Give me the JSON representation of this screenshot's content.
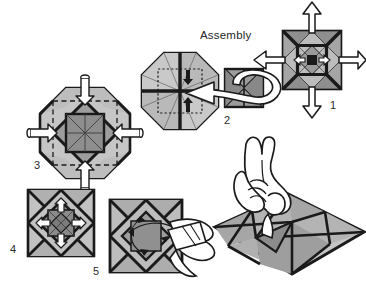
{
  "figure": {
    "title": "Assembly",
    "kind": "origami-assembly-diagram",
    "background_color": "#ffffff",
    "palette": {
      "ink": "#1a1a1a",
      "line": "#222222",
      "fill_light": "#c9c9c9",
      "fill_mid": "#a8a8a8",
      "fill_dark": "#8a8a8a",
      "fill_darker": "#707070",
      "arrow_fill": "#ffffff",
      "arrow_stroke": "#1a1a1a",
      "dash": "#2a2a2a"
    }
  },
  "steps": [
    {
      "number": "1",
      "label_x": 330,
      "label_y": 100,
      "shape": "square",
      "note": "Square module with four white outward arrows (up, down, left, right)",
      "arrows": [
        "up",
        "down",
        "left",
        "right"
      ]
    },
    {
      "number": "2",
      "label_x": 224,
      "label_y": 115,
      "shape": "octagon",
      "note": "Octagon unit with dotted inner square; curved white arrow brings a small square module into the centre",
      "arrows": [
        "curved-left"
      ]
    },
    {
      "number": "3",
      "label_x": 34,
      "label_y": 160,
      "shape": "octagon",
      "note": "Octagon with inner square and dashed fold lines; four small white arrows tuck flaps inward",
      "arrows": [
        "in-top",
        "in-bottom",
        "in-left",
        "in-right"
      ]
    },
    {
      "number": "4",
      "label_x": 10,
      "label_y": 244,
      "shape": "square",
      "note": "Square with inner diamond; four short white arrows radiate from the centre",
      "arrows": [
        "up",
        "down",
        "left",
        "right"
      ]
    },
    {
      "number": "5",
      "label_x": 93,
      "label_y": 266,
      "shape": "square",
      "note": "Square with flaps pulled out to the right forming three dimensional petals"
    }
  ],
  "hand_illustration": {
    "note": "Line drawing of a right hand pinching the centre of the finished star-patterned sheet shown in perspective"
  }
}
